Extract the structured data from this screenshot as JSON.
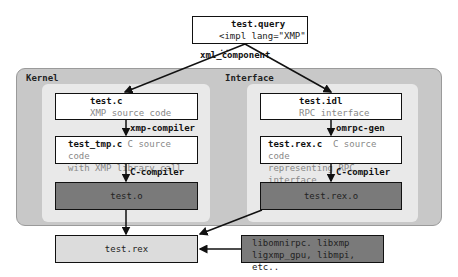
{
  "query": {
    "title": "test.query",
    "code": "<impl lang=\"XMP\" .."
  },
  "edge_top": "xml_component",
  "panels": {
    "kernel": {
      "label": "Kernel"
    },
    "interface": {
      "label": "Interface"
    }
  },
  "kernel": {
    "source": {
      "title": "test.c",
      "desc": "XMP source code"
    },
    "step1": "xmp-compiler",
    "tmp": {
      "title": "test_tmp.c",
      "desc1": "C source code",
      "desc2": "with XMP library call"
    },
    "step2": "C-compiler",
    "object": {
      "title": "test.o"
    }
  },
  "interface": {
    "source": {
      "title": "test.idl",
      "desc": "RPC interface"
    },
    "step1": "omrpc-gen",
    "gen": {
      "title": "test.rex.c",
      "desc1": "C source code",
      "desc2": "representing RPC interface"
    },
    "step2": "C-compiler",
    "object": {
      "title": "test.rex.o"
    }
  },
  "output": {
    "title": "test.rex"
  },
  "libs": {
    "line1": "libomnirpc. libxmp",
    "line2": "ligxmp_gpu, libmpi, etc.."
  },
  "colors": {
    "outer": "#c8c8c8",
    "inner": "#e9e9e9",
    "dark_box": "#7a7a7a",
    "output_box": "#dcdcdc"
  }
}
